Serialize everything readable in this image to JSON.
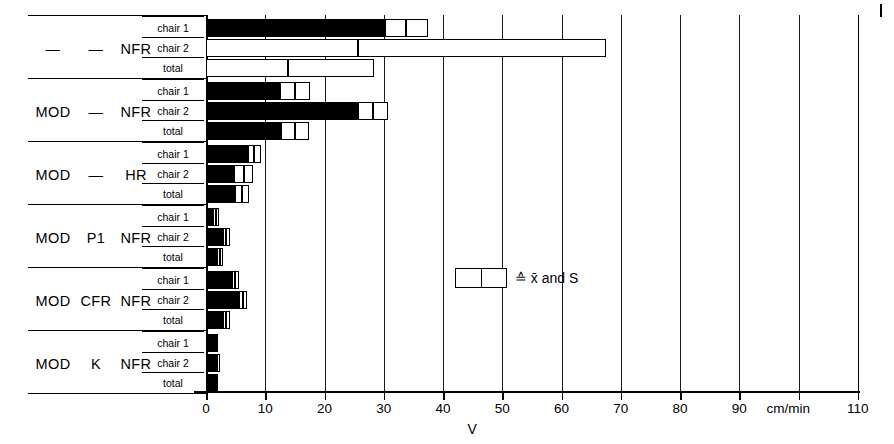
{
  "chart_data": {
    "type": "bar",
    "orientation": "horizontal",
    "title": "",
    "xlabel": "V",
    "ylabel": "",
    "x_unit": "cm/min",
    "xlim": [
      0,
      110
    ],
    "xticks": [
      0,
      10,
      20,
      30,
      40,
      50,
      60,
      70,
      80,
      90,
      100,
      110
    ],
    "xticklabels": [
      "0",
      "10",
      "20",
      "30",
      "40",
      "50",
      "60",
      "70",
      "80",
      "90",
      "",
      "110"
    ],
    "grid": true,
    "legend": {
      "symbol": "box-with-divider",
      "text": "≙ x̄ and S",
      "position": "inside-middle-right"
    },
    "row_labels": [
      "chair 1",
      "chair 2",
      "total"
    ],
    "value_kind": "mean and standard deviation",
    "groups": [
      {
        "name_parts": [
          "—",
          "—",
          "NFR"
        ],
        "rows": [
          {
            "label": "chair 1",
            "mean": 33.8,
            "sd": 3.6
          },
          {
            "label": "chair 2",
            "mean": 25.6,
            "sd": 42.0
          },
          {
            "label": "total",
            "mean": 13.8,
            "sd": 14.6
          }
        ]
      },
      {
        "name_parts": [
          "MOD",
          "—",
          "NFR"
        ],
        "rows": [
          {
            "label": "chair 1",
            "mean": 15.0,
            "sd": 2.5
          },
          {
            "label": "chair 2",
            "mean": 28.2,
            "sd": 2.6
          },
          {
            "label": "total",
            "mean": 15.0,
            "sd": 2.4
          }
        ]
      },
      {
        "name_parts": [
          "MOD",
          "—",
          "HR"
        ],
        "rows": [
          {
            "label": "chair 1",
            "mean": 8.1,
            "sd": 1.1
          },
          {
            "label": "chair 2",
            "mean": 6.4,
            "sd": 1.6
          },
          {
            "label": "total",
            "mean": 6.1,
            "sd": 1.2
          }
        ]
      },
      {
        "name_parts": [
          "MOD",
          "P1",
          "NFR"
        ],
        "rows": [
          {
            "label": "chair 1",
            "mean": 1.6,
            "sd": 0.5
          },
          {
            "label": "chair 2",
            "mean": 3.4,
            "sd": 0.6
          },
          {
            "label": "total",
            "mean": 2.4,
            "sd": 0.5
          }
        ]
      },
      {
        "name_parts": [
          "MOD",
          "CFR",
          "NFR"
        ],
        "rows": [
          {
            "label": "chair 1",
            "mean": 4.9,
            "sd": 0.6
          },
          {
            "label": "chair 2",
            "mean": 6.3,
            "sd": 0.7
          },
          {
            "label": "total",
            "mean": 3.4,
            "sd": 0.6
          }
        ]
      },
      {
        "name_parts": [
          "MOD",
          "K",
          "NFR"
        ],
        "rows": [
          {
            "label": "chair 1",
            "mean": 1.6,
            "sd": 0.4
          },
          {
            "label": "chair 2",
            "mean": 1.9,
            "sd": 0.4
          },
          {
            "label": "total",
            "mean": 1.7,
            "sd": 0.4
          }
        ]
      }
    ]
  },
  "axis": {
    "unit_label": "cm/min",
    "variable_label": "V"
  }
}
